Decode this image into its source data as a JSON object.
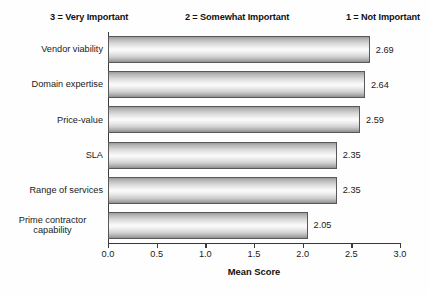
{
  "chart_data": {
    "type": "bar",
    "orientation": "horizontal",
    "title": "",
    "header_note": "3 = Very Important    2 = Somewhat Important    1 = Not Important",
    "scale_legend": [
      "3 = Very Important",
      "2 = Somewhat Important",
      "1 = Not Important"
    ],
    "categories": [
      "Vendor viability",
      "Domain expertise",
      "Price-value",
      "SLA",
      "Range of services",
      "Prime contractor\ncapability"
    ],
    "values": [
      2.69,
      2.64,
      2.59,
      2.35,
      2.35,
      2.05
    ],
    "value_labels": [
      "2.69",
      "2.64",
      "2.59",
      "2.35",
      "2.35",
      "2.05"
    ],
    "xlabel": "Mean Score",
    "ylabel": "",
    "xlim": [
      0.0,
      3.0
    ],
    "xticks": [
      0.0,
      0.5,
      1.0,
      1.5,
      2.0,
      2.5,
      3.0
    ],
    "xtick_labels": [
      "0.0",
      "0.5",
      "1.0",
      "1.5",
      "2.0",
      "2.5",
      "3.0"
    ],
    "grid": false,
    "legend": false,
    "bar_style": "cylindrical-gray-gradient",
    "colors": {
      "bar_edge": "#58585a",
      "bar_light": "#fbfbfb",
      "bar_dark": "#8f8f8f",
      "axis": "#3a3a3a",
      "text": "#1a1a1a",
      "background": "#fefefe"
    }
  }
}
